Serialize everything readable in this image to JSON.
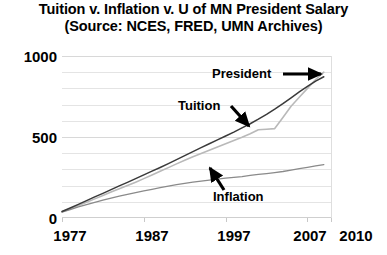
{
  "chart_data": {
    "type": "line",
    "title": "Tuition v. Inflation v. U of MN President Salary",
    "subtitle": "(Source: NCES, FRED, UMN Archives)",
    "title_line1": "Tuition v. Inflation v. U of MN President Salary",
    "title_line2": "(Source: NCES, FRED, UMN Archives)",
    "xlabel": "",
    "ylabel": "",
    "xlim": [
      1977,
      2010
    ],
    "ylim": [
      0,
      1000
    ],
    "grid": "horizontal",
    "legend": "none",
    "y_ticks": [
      0,
      500,
      1000
    ],
    "y_tick_labels": [
      "0",
      "500",
      "1000"
    ],
    "y_minor_step": 100,
    "x_ticks": [
      1977,
      1987,
      1997,
      2007,
      2010
    ],
    "x_tick_labels": [
      "1977",
      "1987",
      "1997",
      "2007",
      "2010"
    ],
    "annotations": [
      {
        "name": "president",
        "text": "President",
        "arrow": "right"
      },
      {
        "name": "tuition",
        "text": "Tuition",
        "arrow": "down-right"
      },
      {
        "name": "inflation",
        "text": "Inflation",
        "arrow": "up-left"
      }
    ],
    "x": [
      1977,
      1978,
      1979,
      1980,
      1981,
      1982,
      1983,
      1984,
      1985,
      1986,
      1987,
      1988,
      1989,
      1990,
      1991,
      1992,
      1993,
      1994,
      1995,
      1996,
      1997,
      1998,
      1999,
      2000,
      2001,
      2002,
      2003,
      2004,
      2005,
      2006,
      2007,
      2008,
      2009
    ],
    "series": [
      {
        "name": "President",
        "color": "#3a3a3a",
        "values": [
          40,
          62,
          84,
          107,
          130,
          152,
          175,
          198,
          220,
          243,
          266,
          289,
          312,
          336,
          360,
          385,
          410,
          434,
          458,
          482,
          506,
          530,
          556,
          582,
          610,
          640,
          672,
          706,
          742,
          778,
          812,
          845,
          872
        ]
      },
      {
        "name": "Tuition",
        "color": "#b9b9b9",
        "values": [
          38,
          57,
          77,
          97,
          118,
          139,
          160,
          180,
          200,
          221,
          243,
          265,
          288,
          311,
          334,
          356,
          378,
          398,
          418,
          438,
          458,
          478,
          498,
          520,
          545,
          548,
          552,
          620,
          690,
          745,
          800,
          855,
          900
        ]
      },
      {
        "name": "Inflation",
        "color": "#8a8a8a",
        "values": [
          36,
          52,
          68,
          83,
          97,
          110,
          123,
          135,
          146,
          157,
          167,
          177,
          187,
          197,
          206,
          214,
          221,
          228,
          234,
          240,
          246,
          251,
          256,
          263,
          269,
          274,
          280,
          287,
          296,
          305,
          313,
          322,
          330
        ]
      }
    ]
  },
  "axis": {
    "y_label_0": "0",
    "y_label_500": "500",
    "y_label_1000": "1000",
    "x_label_1977": "1977",
    "x_label_1987": "1987",
    "x_label_1997": "1997",
    "x_label_2007": "2007",
    "x_label_2010": "2010"
  },
  "labels": {
    "president": "President",
    "tuition": "Tuition",
    "inflation": "Inflation"
  }
}
